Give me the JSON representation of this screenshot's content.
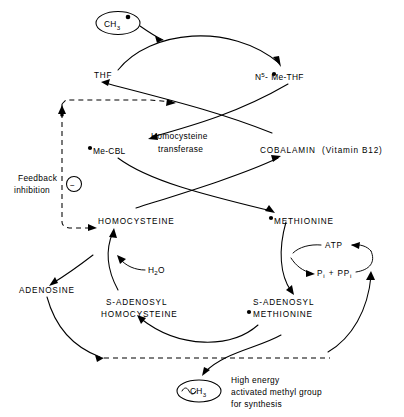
{
  "diagram": {
    "nodes": {
      "ch3_source": {
        "label": "CH",
        "sub": "3",
        "dot": "●",
        "shape": "ellipse"
      },
      "thf": {
        "label": "THF"
      },
      "n5_me_thf": {
        "prefix": "N",
        "sup": "5",
        "dash": "-",
        "dot": "●",
        "suffix": "Me-THF",
        "full": "N5-●Me-THF"
      },
      "me_cbl": {
        "dot": "●",
        "label": "Me-CBL",
        "full": "●Me-CBL"
      },
      "cobalamin": {
        "label": "COBALAMIN  (Vitamin B12)"
      },
      "enzyme": {
        "line1": "Homocysteine",
        "line2": "transferase"
      },
      "homocysteine": {
        "label": "HOMOCYSTEINE"
      },
      "methionine": {
        "dot": "●",
        "label": "METHIONINE",
        "full": "●METHIONINE"
      },
      "atp": {
        "label": "ATP"
      },
      "pi_ppi": {
        "p1": "P",
        "sub1": "i",
        "plus": " + PP",
        "sub2": "i",
        "full": "Pi + PPi"
      },
      "water": {
        "label": "H",
        "sub": "2",
        "suffix": "O",
        "full": "H2O"
      },
      "adenosine": {
        "label": "ADENOSINE"
      },
      "sah": {
        "line1": "S-ADENOSYL",
        "line2": "HOMOCYSTEINE"
      },
      "sam": {
        "line1": "S-ADENOSYL",
        "dot": "●",
        "line2": "METHIONINE"
      },
      "feedback": {
        "line1": "Feedback",
        "line2": "inhibition",
        "sign": "−"
      },
      "product": {
        "squiggle": "∿",
        "label": "CH",
        "sub": "3",
        "full": "∿CH3"
      },
      "product_note": {
        "line1": "High energy",
        "line2": "activated methyl group",
        "line3": "for synthesis"
      }
    },
    "colors": {
      "ink": "#000000",
      "background": "#ffffff"
    }
  }
}
